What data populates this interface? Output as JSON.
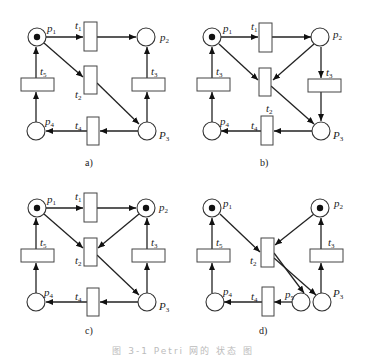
{
  "figure": {
    "caption": "图 3-1  Petri 网的 状态 图",
    "subfigures": [
      {
        "id": "a",
        "label": "a)",
        "places": [
          {
            "name": "p",
            "sub": "1",
            "tokens": 1
          },
          {
            "name": "p",
            "sub": "2",
            "tokens": 0
          },
          {
            "name": "P",
            "sub": "3",
            "tokens": 0
          },
          {
            "name": "p",
            "sub": "4",
            "tokens": 0
          }
        ],
        "transitions": [
          {
            "name": "t",
            "sub": "1"
          },
          {
            "name": "t",
            "sub": "2"
          },
          {
            "name": "t",
            "sub": "3"
          },
          {
            "name": "t",
            "sub": "4"
          },
          {
            "name": "t",
            "sub": "5"
          }
        ],
        "arcs": [
          "p1->t1",
          "t1->p2",
          "p1->t2",
          "t2->p3",
          "p3->t3",
          "t3->p2",
          "p3->t4",
          "t4->p4",
          "p4->t5",
          "t5->p1"
        ]
      },
      {
        "id": "b",
        "label": "b)",
        "places": [
          {
            "name": "p",
            "sub": "1",
            "tokens": 1
          },
          {
            "name": "p",
            "sub": "2",
            "tokens": 0
          },
          {
            "name": "P",
            "sub": "3",
            "tokens": 0
          },
          {
            "name": "p",
            "sub": "4",
            "tokens": 0
          }
        ],
        "transitions": [
          {
            "name": "t",
            "sub": "1"
          },
          {
            "name": "t",
            "sub": "2"
          },
          {
            "name": "t",
            "sub": "3"
          },
          {
            "name": "t",
            "sub": "4"
          },
          {
            "name": "t",
            "sub": "3"
          }
        ],
        "arcs": [
          "p1->t1",
          "t1->p2",
          "p1->t2",
          "p2->t2",
          "t2->p3",
          "p2->t3",
          "t3->p3",
          "p3->t4",
          "t4->p4",
          "p4->t5",
          "t5->p1"
        ]
      },
      {
        "id": "c",
        "label": "c)",
        "places": [
          {
            "name": "p",
            "sub": "1",
            "tokens": 1
          },
          {
            "name": "p",
            "sub": "2",
            "tokens": 1
          },
          {
            "name": "P",
            "sub": "3",
            "tokens": 0
          },
          {
            "name": "p",
            "sub": "4",
            "tokens": 0
          }
        ],
        "transitions": [
          {
            "name": "t",
            "sub": "1"
          },
          {
            "name": "t",
            "sub": "2"
          },
          {
            "name": "t",
            "sub": "3"
          },
          {
            "name": "t",
            "sub": "4"
          },
          {
            "name": "t",
            "sub": "5"
          }
        ],
        "arcs": [
          "p1->t1",
          "t1->p2",
          "p1->t2",
          "p2->t2",
          "t2->p3",
          "p3->t3",
          "t3->p2",
          "p3->t4",
          "t4->p4",
          "p4->t5",
          "t5->p1"
        ]
      },
      {
        "id": "d",
        "label": "d)",
        "places": [
          {
            "name": "p",
            "sub": "1",
            "tokens": 1
          },
          {
            "name": "p",
            "sub": "2",
            "tokens": 1
          },
          {
            "name": "P",
            "sub": "3",
            "tokens": 0
          },
          {
            "name": "p",
            "sub": "4",
            "tokens": 0
          },
          {
            "name": "p",
            "sub": "5",
            "tokens": 0
          }
        ],
        "transitions": [
          {
            "name": "t",
            "sub": "2"
          },
          {
            "name": "t",
            "sub": "3"
          },
          {
            "name": "t",
            "sub": "4"
          },
          {
            "name": "t",
            "sub": "5"
          }
        ],
        "arcs": [
          "p1->t2",
          "p2->t2",
          "t2->p5",
          "t2->p3",
          "p3->t3",
          "t3->p2",
          "p5->t4",
          "t4->p4",
          "p4->t5",
          "t5->p1"
        ]
      }
    ]
  }
}
